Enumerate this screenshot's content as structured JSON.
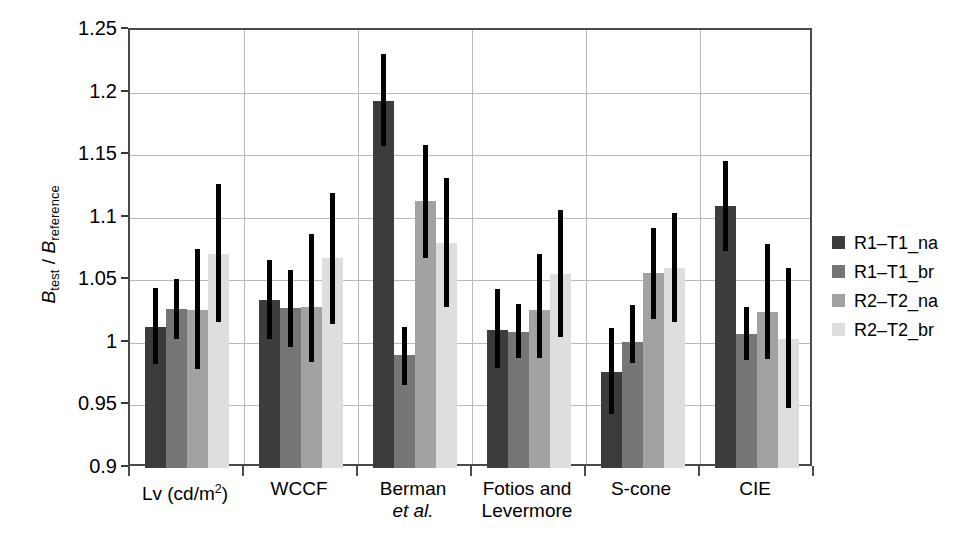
{
  "chart_data": {
    "type": "bar",
    "title": "",
    "xlabel": "",
    "ylabel": "B_test / B_reference",
    "ylabel_parts": {
      "num_symbol": "B",
      "num_sub": "test",
      "separator": " / ",
      "den_symbol": "B",
      "den_sub": "reference"
    },
    "ylim": [
      0.9,
      1.25
    ],
    "yticks": [
      0.9,
      0.95,
      1.0,
      1.05,
      1.1,
      1.15,
      1.2,
      1.25
    ],
    "ytick_labels": [
      "0.9",
      "0.95",
      "1",
      "1.05",
      "1.1",
      "1.15",
      "1.2",
      "1.25"
    ],
    "grid": "horizontal-and-group-separators",
    "legend_position": "right",
    "error_bars": "vertical-lines-no-caps",
    "categories": [
      "Lv (cd/m2)",
      "WCCF",
      "Berman et al.",
      "Fotios and Levermore",
      "S-cone",
      "CIE"
    ],
    "category_labels": [
      {
        "line1": "Lv (cd/m",
        "sup": "2",
        "line1_end": ")",
        "line2": "",
        "line2_italic": false
      },
      {
        "line1": "WCCF",
        "sup": "",
        "line1_end": "",
        "line2": "",
        "line2_italic": false
      },
      {
        "line1": "Berman",
        "sup": "",
        "line1_end": "",
        "line2": "et al.",
        "line2_italic": true
      },
      {
        "line1": "Fotios and",
        "sup": "",
        "line1_end": "",
        "line2": "Levermore",
        "line2_italic": false
      },
      {
        "line1": "S-cone",
        "sup": "",
        "line1_end": "",
        "line2": "",
        "line2_italic": false
      },
      {
        "line1": "CIE",
        "sup": "",
        "line1_end": "",
        "line2": "",
        "line2_italic": false
      }
    ],
    "series": [
      {
        "name": "R1-T1_na",
        "color": "#3c3c3c",
        "values": [
          1.013,
          1.034,
          1.193,
          1.01,
          0.977,
          1.109
        ],
        "err_low": [
          0.983,
          1.003,
          1.157,
          0.98,
          0.943,
          1.073
        ],
        "err_high": [
          1.044,
          1.066,
          1.231,
          1.043,
          1.012,
          1.145
        ]
      },
      {
        "name": "R1-T1_br",
        "color": "#767676",
        "values": [
          1.027,
          1.028,
          0.99,
          1.009,
          1.001,
          1.007
        ],
        "err_low": [
          1.003,
          0.997,
          0.966,
          0.988,
          0.984,
          0.986
        ],
        "err_high": [
          1.051,
          1.058,
          1.013,
          1.031,
          1.03,
          1.029
        ]
      },
      {
        "name": "R2-T2_na",
        "color": "#a2a2a2",
        "values": [
          1.026,
          1.029,
          1.113,
          1.026,
          1.056,
          1.025
        ],
        "err_low": [
          0.979,
          0.985,
          1.068,
          0.988,
          1.019,
          0.987
        ],
        "err_high": [
          1.075,
          1.087,
          1.158,
          1.071,
          1.092,
          1.079
        ]
      },
      {
        "name": "R2-T2_br",
        "color": "#dedede",
        "values": [
          1.071,
          1.068,
          1.08,
          1.055,
          1.06,
          1.003
        ],
        "err_low": [
          1.017,
          1.015,
          1.029,
          1.005,
          1.017,
          0.948
        ],
        "err_high": [
          1.127,
          1.12,
          1.132,
          1.106,
          1.104,
          1.06
        ]
      }
    ]
  },
  "legend": {
    "items": [
      {
        "label": "R1–T1_na",
        "color": "#3c3c3c"
      },
      {
        "label": "R1–T1_br",
        "color": "#767676"
      },
      {
        "label": "R2–T2_na",
        "color": "#a2a2a2"
      },
      {
        "label": "R2–T2_br",
        "color": "#dedede"
      }
    ]
  },
  "style": {
    "axis_color": "#4a4a4a",
    "grid_color": "#b9b9b9",
    "error_bar_color": "#000000",
    "background": "#ffffff"
  }
}
